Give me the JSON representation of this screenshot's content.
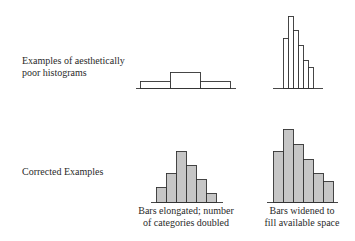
{
  "rows": [
    {
      "label_line1": "Examples of aesthetically",
      "label_line2": "poor histograms"
    },
    {
      "label_line1": "Corrected Examples"
    }
  ],
  "captions": {
    "left_line1": "Bars elongated; number",
    "left_line2": "of categories doubled",
    "right_line1": "Bars widened to",
    "right_line2": "fill available space"
  },
  "colors": {
    "outline": "#333333",
    "fill_poor": "#ffffff",
    "fill_corrected": "#c6c6c6"
  },
  "histograms": [
    {
      "name": "poor-wide-histogram",
      "fill": "#ffffff",
      "baseline": {
        "y": 88,
        "x1": 136,
        "x2": 236
      },
      "bars": [
        {
          "x": 140,
          "w": 30,
          "top": 81
        },
        {
          "x": 170,
          "w": 30,
          "top": 72
        },
        {
          "x": 200,
          "w": 30,
          "top": 81
        }
      ]
    },
    {
      "name": "poor-narrow-histogram",
      "fill": "#ffffff",
      "baseline": {
        "y": 88,
        "x1": 273,
        "x2": 323
      },
      "bars": [
        {
          "x": 283,
          "w": 5,
          "top": 38
        },
        {
          "x": 288,
          "w": 5,
          "top": 16
        },
        {
          "x": 293,
          "w": 5,
          "top": 30
        },
        {
          "x": 298,
          "w": 5,
          "top": 45
        },
        {
          "x": 303,
          "w": 5,
          "top": 60
        },
        {
          "x": 308,
          "w": 5,
          "top": 67
        }
      ]
    },
    {
      "name": "corrected-elongated-histogram",
      "fill": "#c6c6c6",
      "baseline": {
        "y": 202,
        "x1": 151,
        "x2": 223
      },
      "bars": [
        {
          "x": 156,
          "w": 10,
          "top": 187
        },
        {
          "x": 166,
          "w": 10,
          "top": 173
        },
        {
          "x": 176,
          "w": 10,
          "top": 151
        },
        {
          "x": 186,
          "w": 10,
          "top": 165
        },
        {
          "x": 196,
          "w": 10,
          "top": 179
        },
        {
          "x": 206,
          "w": 10,
          "top": 193
        }
      ]
    },
    {
      "name": "corrected-widened-histogram",
      "fill": "#c6c6c6",
      "baseline": {
        "y": 202,
        "x1": 267,
        "x2": 338
      },
      "bars": [
        {
          "x": 273,
          "w": 10,
          "top": 151
        },
        {
          "x": 283,
          "w": 10,
          "top": 129
        },
        {
          "x": 293,
          "w": 10,
          "top": 144
        },
        {
          "x": 303,
          "w": 10,
          "top": 159
        },
        {
          "x": 313,
          "w": 10,
          "top": 173
        },
        {
          "x": 323,
          "w": 10,
          "top": 181
        }
      ]
    }
  ]
}
